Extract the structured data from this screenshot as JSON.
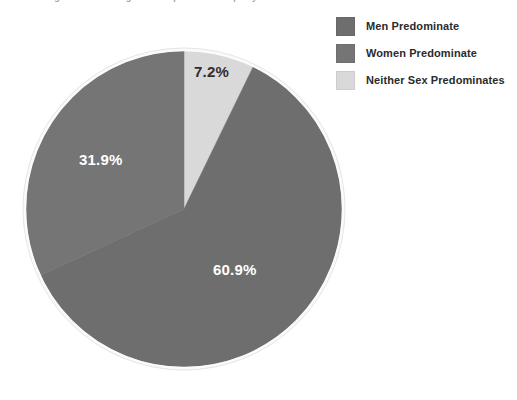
{
  "title": {
    "text": "Figure 1. Percentage of Occupational Groups by Sex Concentration"
  },
  "chart_data": {
    "type": "pie",
    "title": "",
    "subtitle": "",
    "xlabel": "",
    "ylabel": "",
    "legend_position": "top-right",
    "grid": false,
    "categories": [
      "Men Predominate",
      "Women Predominate",
      "Neither Sex Predominates"
    ],
    "values": [
      60.9,
      31.9,
      7.2
    ],
    "value_labels": [
      "60.9%",
      "31.9%",
      "7.2%"
    ],
    "colors": [
      "#6e6e6e",
      "#757575",
      "#d9d9d9"
    ],
    "label_text_colors": [
      "#ffffff",
      "#ffffff",
      "#2f2f2f"
    ],
    "start_angle_deg": 0,
    "direction": "clockwise",
    "slices": [
      {
        "name": "Neither Sex Predominates",
        "value": 7.2,
        "label": "7.2%",
        "color": "#d9d9d9",
        "start_deg": 0,
        "end_deg": 25.92
      },
      {
        "name": "Men Predominate",
        "value": 60.9,
        "label": "60.9%",
        "color": "#6e6e6e",
        "start_deg": 25.92,
        "end_deg": 245.16
      },
      {
        "name": "Women Predominate",
        "value": 31.9,
        "label": "31.9%",
        "color": "#757575",
        "start_deg": 245.16,
        "end_deg": 360
      }
    ]
  },
  "legend": {
    "items": [
      {
        "label": "Men Predominate",
        "color": "#6e6e6e"
      },
      {
        "label": "Women Predominate",
        "color": "#757575"
      },
      {
        "label": "Neither Sex Predominates",
        "color": "#d9d9d9"
      }
    ]
  },
  "geometry": {
    "center_x": 184,
    "center_y": 209,
    "radius": 158
  }
}
